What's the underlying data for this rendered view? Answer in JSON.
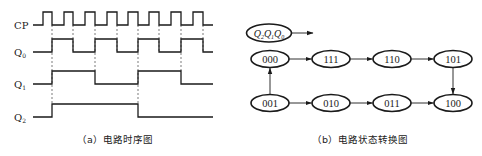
{
  "timing_diagram": {
    "caption": "（a）电路时序图",
    "signals": [
      {
        "name": "CP",
        "label_main": "CP",
        "label_sub": "",
        "low_y": 25,
        "high_y": 12,
        "edges": [
          43,
          52,
          64,
          73,
          85,
          95,
          107,
          117,
          128,
          138,
          149,
          159,
          171,
          181,
          193,
          203
        ],
        "start_x": 33,
        "end_x": 213,
        "start_level": 0
      },
      {
        "name": "Q0",
        "label_main": "Q",
        "label_sub": "0",
        "low_y": 52,
        "high_y": 39,
        "edges": [
          52,
          73,
          95,
          117,
          138,
          159,
          181,
          203
        ],
        "start_x": 33,
        "end_x": 213,
        "start_level": 0
      },
      {
        "name": "Q1",
        "label_main": "Q",
        "label_sub": "1",
        "low_y": 84,
        "high_y": 71,
        "edges": [
          52,
          95,
          138,
          181
        ],
        "start_x": 33,
        "end_x": 213,
        "start_level": 0
      },
      {
        "name": "Q2",
        "label_main": "Q",
        "label_sub": "2",
        "low_y": 117,
        "high_y": 104,
        "edges": [
          52,
          138
        ],
        "start_x": 33,
        "end_x": 213,
        "start_level": 0
      }
    ],
    "dashed_lines": [
      {
        "x": 52,
        "y1": 25,
        "y2": 104
      },
      {
        "x": 73,
        "y1": 25,
        "y2": 52
      },
      {
        "x": 95,
        "y1": 25,
        "y2": 71
      },
      {
        "x": 117,
        "y1": 25,
        "y2": 52
      },
      {
        "x": 138,
        "y1": 25,
        "y2": 104
      },
      {
        "x": 159,
        "y1": 25,
        "y2": 52
      },
      {
        "x": 181,
        "y1": 25,
        "y2": 71
      },
      {
        "x": 203,
        "y1": 25,
        "y2": 52
      }
    ]
  },
  "state_diagram": {
    "caption": "（b）电路状态转换图",
    "legend": {
      "text_parts": [
        "Q",
        "2",
        "Q",
        "1",
        "Q",
        "0"
      ],
      "label": "Q2Q1Q0",
      "cx": 269,
      "cy": 33
    },
    "states": [
      {
        "id": "000",
        "label": "000",
        "cx": 270,
        "cy": 59
      },
      {
        "id": "111",
        "label": "111",
        "cx": 331,
        "cy": 59
      },
      {
        "id": "110",
        "label": "110",
        "cx": 392,
        "cy": 59
      },
      {
        "id": "101",
        "label": "101",
        "cx": 453,
        "cy": 59
      },
      {
        "id": "001",
        "label": "001",
        "cx": 270,
        "cy": 103
      },
      {
        "id": "010",
        "label": "010",
        "cx": 331,
        "cy": 103
      },
      {
        "id": "011",
        "label": "011",
        "cx": 392,
        "cy": 103
      },
      {
        "id": "100",
        "label": "100",
        "cx": 453,
        "cy": 103
      }
    ],
    "transitions": [
      {
        "from": "000",
        "to": "111"
      },
      {
        "from": "111",
        "to": "110"
      },
      {
        "from": "110",
        "to": "101"
      },
      {
        "from": "101",
        "to": "100"
      },
      {
        "from": "001",
        "to": "000"
      },
      {
        "from": "001",
        "to": "010"
      },
      {
        "from": "010",
        "to": "011"
      },
      {
        "from": "011",
        "to": "100"
      }
    ]
  }
}
